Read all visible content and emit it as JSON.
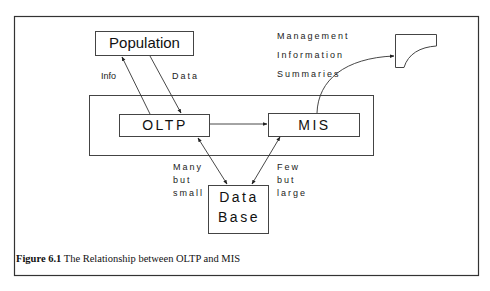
{
  "diagram": {
    "nodes": {
      "population": "Population",
      "oltp": "OLTP",
      "mis": "MIS",
      "database_line1": "Data",
      "database_line2": "Base"
    },
    "edge_labels": {
      "info": "Info",
      "data": "Data",
      "many_but_small": [
        "Many",
        "but",
        "small"
      ],
      "few_but_large": [
        "Few",
        "but",
        "large"
      ],
      "mis_output": [
        "Management",
        "Information",
        "Summaries"
      ]
    },
    "edges": [
      {
        "from": "OLTP",
        "to": "Population",
        "label": "Info"
      },
      {
        "from": "Population",
        "to": "OLTP",
        "label": "Data"
      },
      {
        "from": "OLTP",
        "to": "MIS",
        "label": ""
      },
      {
        "from": "OLTP",
        "to": "Data Base",
        "label": "Many but small",
        "bidirectional": true
      },
      {
        "from": "MIS",
        "to": "Data Base",
        "label": "Few but large",
        "bidirectional": true
      },
      {
        "from": "MIS",
        "to": "Document",
        "label": "Management Information Summaries"
      }
    ]
  },
  "caption": {
    "number": "Figure 6.1",
    "text": " The Relationship between OLTP and MIS"
  }
}
